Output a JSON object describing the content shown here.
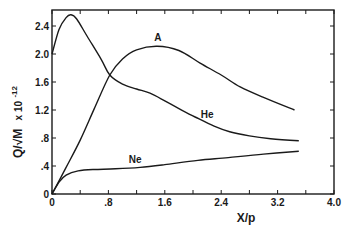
{
  "chart_data": {
    "type": "line",
    "title": "",
    "xlabel": "X/p",
    "ylabel": "Q/√M x 10⁻¹²",
    "xlim": [
      0,
      4.0
    ],
    "ylim": [
      0,
      2.6
    ],
    "grid": false,
    "legend": "inline labels on curves",
    "x_ticks": [
      0,
      0.4,
      0.8,
      1.2,
      1.6,
      2.0,
      2.4,
      2.8,
      3.2,
      3.6,
      4.0
    ],
    "x_tick_labels": [
      "0",
      ".8",
      "1.6",
      "2.4",
      "3.2",
      "4.0"
    ],
    "y_ticks": [
      0,
      0.4,
      0.8,
      1.2,
      1.6,
      2.0,
      2.4
    ],
    "y_tick_labels": [
      "0",
      ".4",
      ".8",
      "1.2",
      "1.6",
      "2.0",
      "2.4"
    ],
    "series": [
      {
        "name": "He",
        "x": [
          0,
          0.1,
          0.2,
          0.27,
          0.35,
          0.5,
          0.7,
          0.82,
          1.0,
          1.2,
          1.39,
          1.6,
          1.8,
          2.03,
          2.3,
          2.52,
          2.8,
          3.1,
          3.5
        ],
        "y": [
          2.0,
          2.35,
          2.52,
          2.56,
          2.5,
          2.25,
          1.92,
          1.7,
          1.57,
          1.5,
          1.44,
          1.33,
          1.22,
          1.1,
          0.97,
          0.89,
          0.83,
          0.79,
          0.76
        ]
      },
      {
        "name": "A",
        "x": [
          0,
          0.2,
          0.4,
          0.6,
          0.82,
          1.0,
          1.2,
          1.49,
          1.8,
          2.1,
          2.4,
          2.67,
          3.0,
          3.44
        ],
        "y": [
          0,
          0.38,
          0.77,
          1.22,
          1.7,
          1.93,
          2.06,
          2.11,
          2.05,
          1.87,
          1.7,
          1.53,
          1.38,
          1.2
        ]
      },
      {
        "name": "Ne",
        "x": [
          0,
          0.1,
          0.2,
          0.37,
          0.6,
          0.9,
          1.25,
          1.6,
          2.07,
          2.5,
          3.0,
          3.5
        ],
        "y": [
          0,
          0.17,
          0.27,
          0.33,
          0.35,
          0.36,
          0.38,
          0.42,
          0.48,
          0.52,
          0.57,
          0.61
        ]
      }
    ],
    "annotations": [
      {
        "text": "A",
        "x": 1.5,
        "y": 2.18
      },
      {
        "text": "He",
        "x": 2.2,
        "y": 1.08
      },
      {
        "text": "Ne",
        "x": 1.18,
        "y": 0.45
      }
    ]
  },
  "labels": {
    "xlabel": "X/p",
    "ylabel_main": "Q/√M",
    "ylabel_exp": "x 10",
    "ylabel_power": "-12",
    "series_a": "A",
    "series_he": "He",
    "series_ne": "Ne"
  }
}
